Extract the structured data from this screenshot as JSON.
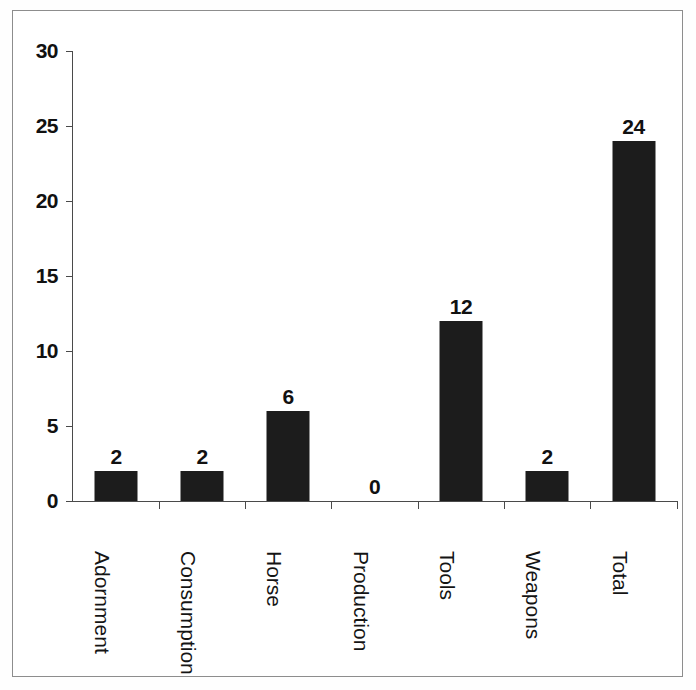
{
  "chart_data": {
    "type": "bar",
    "title": "",
    "subtitle": "",
    "xlabel": "",
    "ylabel": "",
    "categories": [
      "Adornment",
      "Consumption",
      "Horse",
      "Production",
      "Tools",
      "Weapons",
      "Total"
    ],
    "values": [
      2,
      2,
      6,
      0,
      12,
      2,
      24
    ],
    "value_labels": [
      "2",
      "2",
      "6",
      "0",
      "12",
      "2",
      "24"
    ],
    "ylim": [
      0,
      30
    ],
    "y_ticks": [
      30,
      25,
      20,
      15,
      10,
      5,
      0
    ],
    "y_tick_labels": [
      "30",
      "25",
      "20",
      "15",
      "10",
      "5",
      "0"
    ],
    "grid": false,
    "legend": false,
    "legend_position": "none",
    "bar_color": "#1c1c1c",
    "axis_color": "#4a4a4a",
    "background_color": "#ffffff",
    "label_color": "#111111",
    "category_label_rotation": 90
  },
  "figure": {
    "frame_color": "#8d8d8d",
    "has_outer_frame": true
  }
}
